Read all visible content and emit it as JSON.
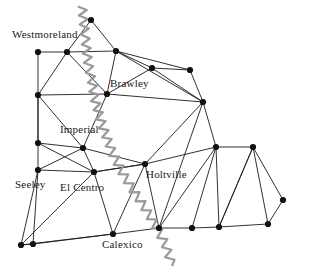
{
  "figure": {
    "background_color": "#ffffff",
    "edge_color": "#1a1a1a",
    "node_color": "#111111",
    "river_color": "#9a9a9a",
    "label_color": "#1a1a1a"
  },
  "labels": [
    {
      "id": "westmoreland",
      "text": "Westmoreland",
      "x": 12,
      "y": 29
    },
    {
      "id": "brawley",
      "text": "Brawley",
      "x": 110,
      "y": 78
    },
    {
      "id": "imperial",
      "text": "Imperial",
      "x": 60,
      "y": 124
    },
    {
      "id": "holtville",
      "text": "Holtville",
      "x": 146,
      "y": 169
    },
    {
      "id": "seeley",
      "text": "Seeley",
      "x": 15,
      "y": 179
    },
    {
      "id": "elcentro",
      "text": "El Centro",
      "x": 60,
      "y": 182
    },
    {
      "id": "calexico",
      "text": "Calexico",
      "x": 102,
      "y": 239
    }
  ],
  "nodes": [
    {
      "id": "n0",
      "x": 38,
      "y": 52
    },
    {
      "id": "n1",
      "x": 67,
      "y": 52
    },
    {
      "id": "n2",
      "x": 116,
      "y": 51
    },
    {
      "id": "n3",
      "x": 91,
      "y": 20
    },
    {
      "id": "n4",
      "x": 152,
      "y": 68
    },
    {
      "id": "n5",
      "x": 190,
      "y": 70
    },
    {
      "id": "n6",
      "x": 203,
      "y": 102
    },
    {
      "id": "n7",
      "x": 38,
      "y": 95
    },
    {
      "id": "n8",
      "x": 107,
      "y": 94
    },
    {
      "id": "n9",
      "x": 38,
      "y": 143
    },
    {
      "id": "n10",
      "x": 83,
      "y": 148
    },
    {
      "id": "n11",
      "x": 38,
      "y": 170
    },
    {
      "id": "n12",
      "x": 94,
      "y": 172
    },
    {
      "id": "n13",
      "x": 145,
      "y": 164
    },
    {
      "id": "n14",
      "x": 216,
      "y": 147
    },
    {
      "id": "n15",
      "x": 253,
      "y": 147
    },
    {
      "id": "n16",
      "x": 21,
      "y": 245
    },
    {
      "id": "n17",
      "x": 33,
      "y": 244
    },
    {
      "id": "n18",
      "x": 113,
      "y": 234
    },
    {
      "id": "n19",
      "x": 159,
      "y": 228
    },
    {
      "id": "n20",
      "x": 192,
      "y": 228
    },
    {
      "id": "n21",
      "x": 219,
      "y": 227
    },
    {
      "id": "n22",
      "x": 268,
      "y": 224
    },
    {
      "id": "n23",
      "x": 283,
      "y": 200
    }
  ],
  "edges": [
    [
      "n0",
      "n1"
    ],
    [
      "n1",
      "n2"
    ],
    [
      "n0",
      "n7"
    ],
    [
      "n1",
      "n7"
    ],
    [
      "n1",
      "n8"
    ],
    [
      "n1",
      "n3"
    ],
    [
      "n3",
      "n2"
    ],
    [
      "n2",
      "n8"
    ],
    [
      "n2",
      "n4"
    ],
    [
      "n2",
      "n6"
    ],
    [
      "n4",
      "n5"
    ],
    [
      "n4",
      "n6"
    ],
    [
      "n5",
      "n6"
    ],
    [
      "n4",
      "n8"
    ],
    [
      "n7",
      "n8"
    ],
    [
      "n7",
      "n9"
    ],
    [
      "n7",
      "n10"
    ],
    [
      "n8",
      "n10"
    ],
    [
      "n8",
      "n6"
    ],
    [
      "n6",
      "n13"
    ],
    [
      "n6",
      "n14"
    ],
    [
      "n9",
      "n10"
    ],
    [
      "n9",
      "n11"
    ],
    [
      "n9",
      "n12"
    ],
    [
      "n10",
      "n11"
    ],
    [
      "n10",
      "n12"
    ],
    [
      "n11",
      "n12"
    ],
    [
      "n10",
      "n13"
    ],
    [
      "n12",
      "n13"
    ],
    [
      "n13",
      "n14"
    ],
    [
      "n13",
      "n19"
    ],
    [
      "n13",
      "n18"
    ],
    [
      "n14",
      "n15"
    ],
    [
      "n14",
      "n19"
    ],
    [
      "n14",
      "n20"
    ],
    [
      "n14",
      "n21"
    ],
    [
      "n15",
      "n21"
    ],
    [
      "n15",
      "n22"
    ],
    [
      "n11",
      "n16"
    ],
    [
      "n11",
      "n17"
    ],
    [
      "n16",
      "n17"
    ],
    [
      "n16",
      "n18"
    ],
    [
      "n17",
      "n18"
    ],
    [
      "n12",
      "n18"
    ],
    [
      "n18",
      "n19"
    ],
    [
      "n19",
      "n20"
    ],
    [
      "n20",
      "n21"
    ],
    [
      "n21",
      "n22"
    ],
    [
      "n22",
      "n23"
    ],
    [
      "n15",
      "n23"
    ],
    [
      "n12",
      "n16"
    ],
    [
      "n13",
      "n12"
    ],
    [
      "n6",
      "n19"
    ],
    [
      "n21",
      "n15"
    ],
    [
      "n9",
      "n7"
    ],
    [
      "n2",
      "n5"
    ]
  ],
  "river": {
    "id": "new-river",
    "points": [
      [
        82,
        6
      ],
      [
        84,
        24
      ],
      [
        86,
        44
      ],
      [
        88,
        62
      ],
      [
        92,
        82
      ],
      [
        95,
        100
      ],
      [
        100,
        118
      ],
      [
        106,
        136
      ],
      [
        113,
        154
      ],
      [
        122,
        172
      ],
      [
        133,
        190
      ],
      [
        145,
        208
      ],
      [
        156,
        226
      ],
      [
        166,
        246
      ],
      [
        172,
        266
      ]
    ]
  }
}
